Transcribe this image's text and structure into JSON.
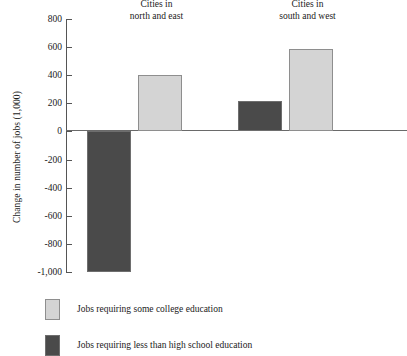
{
  "chart_data": {
    "type": "bar",
    "title": "",
    "xlabel": "",
    "ylabel": "Change in number of jobs (1,000)",
    "ylim": [
      -1000,
      800
    ],
    "ytick_labels": [
      "800",
      "600",
      "400",
      "200",
      "0",
      "-200",
      "-400",
      "-600",
      "-800",
      "-1,000"
    ],
    "ytick_values": [
      800,
      600,
      400,
      200,
      0,
      -200,
      -400,
      -600,
      -800,
      -1000
    ],
    "grid": false,
    "legend_position": "below",
    "categories": [
      "Cities in north and east",
      "Cities in south and west"
    ],
    "category_lines": [
      {
        "line1": "Cities in",
        "line2": "north and east"
      },
      {
        "line1": "Cities in",
        "line2": "south and west"
      }
    ],
    "series": [
      {
        "name": "Jobs requiring less than high school education",
        "color": "#4a4a4a",
        "values": [
          -1000,
          220
        ]
      },
      {
        "name": "Jobs  requiring some college education",
        "color": "#d4d4d4",
        "values": [
          400,
          590
        ]
      }
    ]
  },
  "axis": {
    "y_title": "Change in number of jobs (1,000)",
    "ticks": [
      {
        "label": "800",
        "value": 800
      },
      {
        "label": "600",
        "value": 600
      },
      {
        "label": "400",
        "value": 400
      },
      {
        "label": "200",
        "value": 200
      },
      {
        "label": "0",
        "value": 0
      },
      {
        "label": "-200",
        "value": -200
      },
      {
        "label": "-400",
        "value": -400
      },
      {
        "label": "-600",
        "value": -600
      },
      {
        "label": "-800",
        "value": -800
      },
      {
        "label": "-1,000",
        "value": -1000
      }
    ]
  },
  "groups": [
    {
      "line1": "Cities in",
      "line2": "north and east"
    },
    {
      "line1": "Cities in",
      "line2": "south and west"
    }
  ],
  "bars": [
    {
      "group": 0,
      "series": "dark",
      "value": -1000
    },
    {
      "group": 0,
      "series": "light",
      "value": 400
    },
    {
      "group": 1,
      "series": "dark",
      "value": 220
    },
    {
      "group": 1,
      "series": "light",
      "value": 590
    }
  ],
  "legend": {
    "items": [
      {
        "label": "Jobs  requiring some college education",
        "swatch": "light",
        "color": "#d4d4d4"
      },
      {
        "label": "Jobs requiring less than high school education",
        "swatch": "dark",
        "color": "#4a4a4a"
      }
    ]
  },
  "colors": {
    "light_fill": "#d4d4d4",
    "light_border": "#8e8e8e",
    "dark_fill": "#4a4a4a",
    "dark_border": "#6e6e6e",
    "axis": "#555555",
    "background": "#ffffff"
  }
}
